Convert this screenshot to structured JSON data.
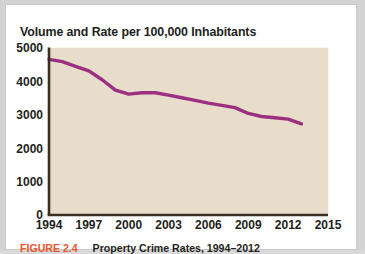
{
  "figure": {
    "title": "Volume and Rate per 100,000 Inhabitants",
    "caption_label": "FIGURE 2.4",
    "caption_text": "Property Crime Rates, 1994–2012",
    "colors": {
      "line": "#9b3080",
      "plot_background": "#e8dccb",
      "gridline": "#fdf6ec",
      "axis": "#3b2f22",
      "caption_accent": "#e8562a",
      "text": "#231f20",
      "card_background": "#ffffff",
      "page_background": "#d3d3d3"
    }
  },
  "chart_data": {
    "type": "line",
    "title": "Volume and Rate per 100,000 Inhabitants",
    "xlabel": "",
    "ylabel": "",
    "xlim": [
      1994,
      2015
    ],
    "ylim": [
      0,
      5000
    ],
    "grid": true,
    "legend": "none",
    "xticks": [
      1994,
      1997,
      2000,
      2003,
      2006,
      2009,
      2012,
      2015
    ],
    "yticks": [
      0,
      1000,
      2000,
      3000,
      4000,
      5000
    ],
    "xtick_labels": [
      "1994",
      "1997",
      "2000",
      "2003",
      "2006",
      "2009",
      "2012",
      "2015"
    ],
    "ytick_labels": [
      "0",
      "1000",
      "2000",
      "3000",
      "4000",
      "5000"
    ],
    "series": [
      {
        "name": "Property crime rate per 100,000 inhabitants",
        "x": [
          1994,
          1995,
          1996,
          1997,
          1998,
          1999,
          2000,
          2001,
          2002,
          2003,
          2004,
          2005,
          2006,
          2007,
          2008,
          2009,
          2010,
          2011,
          2012,
          2013
        ],
        "values": [
          4660,
          4590,
          4450,
          4315,
          4050,
          3740,
          3620,
          3660,
          3660,
          3590,
          3510,
          3430,
          3350,
          3280,
          3215,
          3040,
          2950,
          2910,
          2870,
          2730
        ]
      }
    ]
  }
}
